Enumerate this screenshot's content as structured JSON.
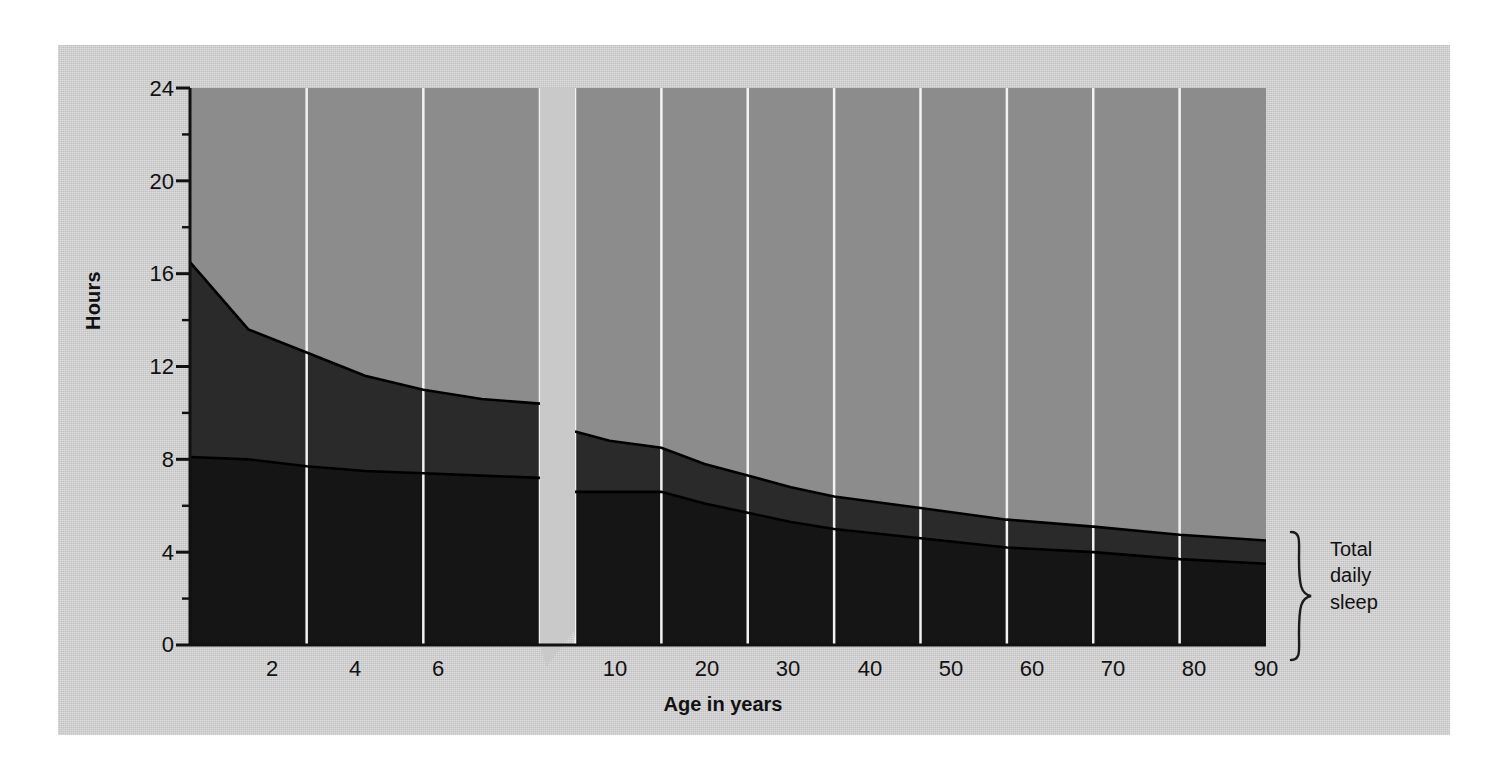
{
  "figure": {
    "background_color": "#ffffff",
    "panel_color": "#c9c9c9",
    "waking_color": "#8c8c8c",
    "rem_color": "#2a2a2a",
    "nrem_color": "#151515",
    "gridline_color": "#f2f2f2",
    "axis_color": "#111111"
  },
  "axes": {
    "y": {
      "label": "Hours",
      "ticks": [
        "0",
        "4",
        "8",
        "12",
        "16",
        "20",
        "24"
      ],
      "tick_values": [
        0,
        4,
        8,
        12,
        16,
        20,
        24
      ],
      "minor_tick_values": [
        2,
        6,
        10,
        14,
        18,
        22
      ],
      "range": [
        0,
        24
      ]
    },
    "x": {
      "label": "Age in years",
      "ticks": [
        "2",
        "4",
        "6",
        "10",
        "20",
        "30",
        "40",
        "50",
        "60",
        "70",
        "80",
        "90"
      ],
      "tick_values": [
        2,
        4,
        6,
        10,
        20,
        30,
        40,
        50,
        60,
        70,
        80,
        90
      ],
      "break_note": "axis break between age 6 and age 10",
      "range": [
        0,
        90
      ]
    }
  },
  "labels": {
    "waking": "Waking",
    "rem": "REM Sleep",
    "nrem": "NREM Sleep",
    "total_line1": "Total",
    "total_line2": "daily",
    "total_line3": "sleep"
  },
  "chart_data": {
    "type": "area",
    "title": "",
    "subtitle": "",
    "xlabel": "Age in years",
    "ylabel": "Hours",
    "xlim": [
      0,
      90
    ],
    "ylim": [
      0,
      24
    ],
    "grid": true,
    "grid_orientation": "vertical",
    "legend_position": "in-plot annotations",
    "stacked": true,
    "axis_break": {
      "after": 6,
      "before": 10
    },
    "x": [
      0,
      1,
      2,
      3,
      4,
      5,
      6,
      10,
      14,
      20,
      25,
      30,
      35,
      40,
      50,
      60,
      70,
      80,
      90
    ],
    "series": [
      {
        "name": "NREM Sleep",
        "color": "#151515",
        "values": [
          8.1,
          8.0,
          7.7,
          7.5,
          7.4,
          7.3,
          7.2,
          6.6,
          6.6,
          6.6,
          6.1,
          5.7,
          5.3,
          5.0,
          4.6,
          4.2,
          4.0,
          3.7,
          3.5
        ]
      },
      {
        "name": "REM Sleep",
        "color": "#2a2a2a",
        "values": [
          8.4,
          5.6,
          4.9,
          4.1,
          3.6,
          3.3,
          3.2,
          2.6,
          2.2,
          1.9,
          1.7,
          1.6,
          1.5,
          1.4,
          1.3,
          1.2,
          1.1,
          1.05,
          1.0
        ]
      },
      {
        "name": "Waking",
        "color": "#8c8c8c",
        "values": [
          7.5,
          10.4,
          11.4,
          12.4,
          13.0,
          13.4,
          13.6,
          14.8,
          15.2,
          15.5,
          16.2,
          16.7,
          17.2,
          17.6,
          18.1,
          18.6,
          18.9,
          19.25,
          19.5
        ]
      }
    ],
    "total_daily_sleep": [
      16.5,
      13.6,
      12.6,
      11.6,
      11.0,
      10.6,
      10.4,
      9.2,
      8.8,
      8.5,
      7.8,
      7.3,
      6.8,
      6.4,
      5.9,
      5.4,
      5.1,
      4.75,
      4.5
    ],
    "annotations": [
      {
        "text": "Waking",
        "x": 40,
        "y": 16.5
      },
      {
        "text": "REM Sleep",
        "x": 5.2,
        "y": 8.6
      },
      {
        "text": "NREM Sleep",
        "x": 4.6,
        "y": 3.3
      },
      {
        "text": "Total daily sleep",
        "x": 95,
        "y": 2.3,
        "marker": "right-brace"
      }
    ]
  }
}
